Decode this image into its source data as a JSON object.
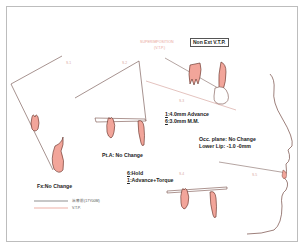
{
  "figure": {
    "header": {
      "superimposition_label": "SUPERIMPOSITION",
      "superimposition_sub": "(V.T.P.)",
      "mode_box": "Non Ext V.T.P."
    },
    "sections": [
      {
        "id": "S.1",
        "label": "S.1",
        "note": "Fx:No Change"
      },
      {
        "id": "S.2",
        "label": "S.2",
        "note": "Pt.A: No Change"
      },
      {
        "id": "S.3",
        "label": "S.3",
        "notes": [
          {
            "tooth": "1",
            "text": ":4.0mm Advance"
          },
          {
            "tooth": "6",
            "text": ":3.0mm M.M."
          }
        ]
      },
      {
        "id": "S.4",
        "label": "S.4",
        "notes": [
          {
            "tooth": "6",
            "text": ":Hold"
          },
          {
            "tooth": "1",
            "text": ":Advance+Torque"
          }
        ]
      },
      {
        "id": "S.5",
        "label": "S.5",
        "notes": [
          {
            "text": "Occ. plane: No Change"
          },
          {
            "text": "Lower Lip: -1.0  -0mm"
          }
        ]
      }
    ],
    "legend": [
      {
        "label": "治療前(17Y00M)",
        "color": "#444444"
      },
      {
        "label": "V.T.P.",
        "color": "#e07a6a"
      }
    ],
    "colors": {
      "outline": "#5a2a22",
      "tooth_fill": "#f2a59a",
      "vtp": "#e07a6a",
      "frame": "#bdbdbd"
    }
  }
}
